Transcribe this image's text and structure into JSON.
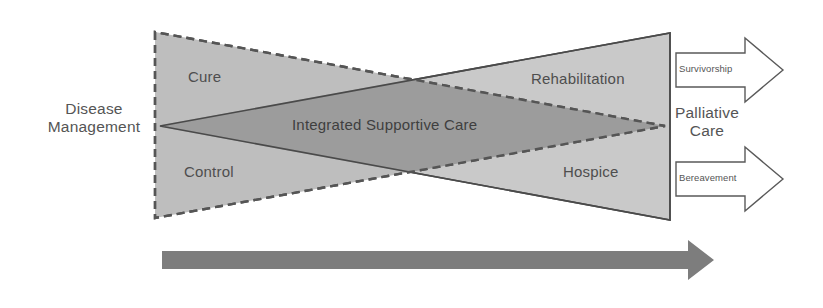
{
  "figure": {
    "type": "conceptual-diagram",
    "title": "",
    "background_color": "#ffffff"
  },
  "labels": {
    "disease_management": "Disease\nManagement",
    "cure": "Cure",
    "control": "Control",
    "integrated_supportive_care": "Integrated Supportive Care",
    "rehabilitation": "Rehabilitation",
    "hospice": "Hospice",
    "palliative_care": "Palliative\nCare",
    "survivorship": "Survivorship",
    "bereavement": "Bereavement"
  },
  "shapes": {
    "disease_triangle": {
      "name": "Disease Management triangle",
      "border_style": "dashed",
      "fill_color": "#b5b5b5",
      "stroke_color": "#555555",
      "points": "155,32 155,218 665,126"
    },
    "palliative_triangle": {
      "name": "Palliative Care triangle",
      "border_style": "solid",
      "fill_color": "#c9c9c9",
      "stroke_color": "#4a4a4a",
      "points": "160,126 670,33 670,220"
    },
    "overlap_region": {
      "name": "Integrated Supportive Care overlap",
      "fill_color": "#9e9e9e"
    },
    "survivorship_arrow": {
      "direction": "right",
      "fill_color": "#ffffff",
      "stroke_color": "#555555"
    },
    "bereavement_arrow": {
      "direction": "right",
      "fill_color": "#ffffff",
      "stroke_color": "#555555"
    },
    "timeline_arrow": {
      "direction": "right",
      "fill_color": "#7d7d7d",
      "label": ""
    }
  },
  "colors": {
    "light_gray": "#c9c9c9",
    "mid_gray": "#b5b5b5",
    "dark_overlap": "#9e9e9e",
    "timeline_gray": "#7d7d7d",
    "text_gray": "#4e4e4e",
    "outline_gray": "#555555"
  }
}
